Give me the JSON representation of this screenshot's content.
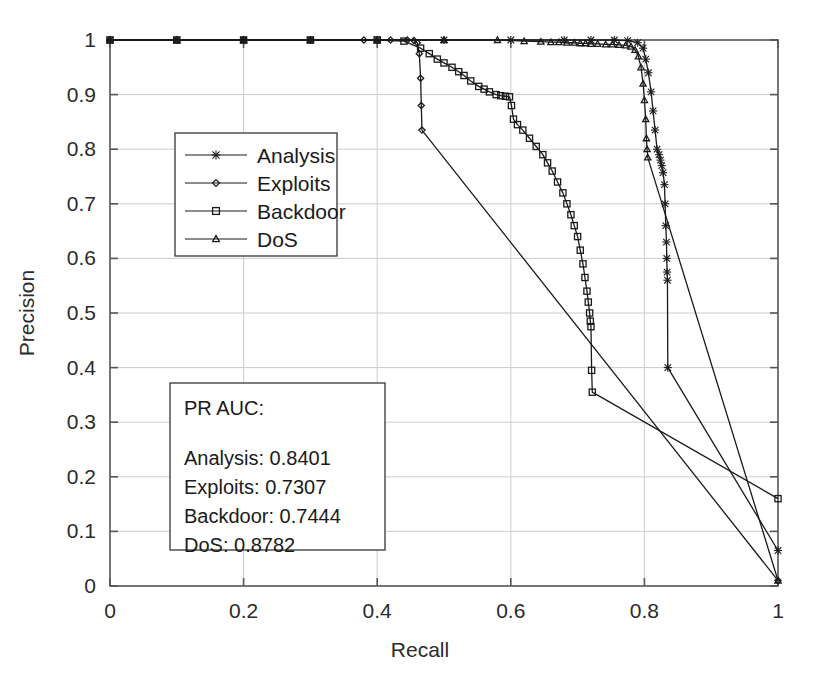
{
  "chart_data": {
    "type": "line",
    "title": "",
    "xlabel": "Recall",
    "ylabel": "Precision",
    "xlim": [
      0,
      1
    ],
    "ylim": [
      0,
      1
    ],
    "grid": true,
    "legend_position": "upper-left-inset",
    "xticks": [
      "0",
      "0.2",
      "0.4",
      "0.6",
      "0.8",
      "1"
    ],
    "xtick_values": [
      0,
      0.2,
      0.4,
      0.6,
      0.8,
      1
    ],
    "yticks": [
      "0",
      "0.1",
      "0.2",
      "0.3",
      "0.4",
      "0.5",
      "0.6",
      "0.7",
      "0.8",
      "0.9",
      "1"
    ],
    "ytick_values": [
      0,
      0.1,
      0.2,
      0.3,
      0.4,
      0.5,
      0.6,
      0.7,
      0.8,
      0.9,
      1
    ],
    "series": [
      {
        "name": "Analysis",
        "marker": "star",
        "color": "#1a1a1a",
        "x": [
          0,
          0.1,
          0.2,
          0.3,
          0.4,
          0.5,
          0.6,
          0.68,
          0.72,
          0.755,
          0.775,
          0.79,
          0.798,
          0.802,
          0.806,
          0.81,
          0.813,
          0.816,
          0.819,
          0.822,
          0.824,
          0.826,
          0.828,
          0.83,
          0.831,
          0.832,
          0.833,
          0.8335,
          0.834,
          0.8345,
          0.835,
          1.0
        ],
        "y": [
          1.0,
          1.0,
          1.0,
          1.0,
          1.0,
          1.0,
          1.0,
          1.0,
          1.0,
          1.0,
          0.999,
          0.995,
          0.985,
          0.965,
          0.94,
          0.905,
          0.87,
          0.835,
          0.8,
          0.79,
          0.78,
          0.77,
          0.757,
          0.735,
          0.7,
          0.66,
          0.63,
          0.6,
          0.575,
          0.56,
          0.4,
          0.065
        ]
      },
      {
        "name": "Exploits",
        "marker": "diamond",
        "color": "#1a1a1a",
        "x": [
          0,
          0.1,
          0.2,
          0.3,
          0.38,
          0.42,
          0.445,
          0.455,
          0.46,
          0.463,
          0.465,
          0.466,
          0.467,
          1.0
        ],
        "y": [
          1.0,
          1.0,
          1.0,
          1.0,
          1.0,
          1.0,
          1.0,
          0.999,
          0.995,
          0.975,
          0.93,
          0.88,
          0.835,
          0.01
        ]
      },
      {
        "name": "Backdoor",
        "marker": "square",
        "color": "#1a1a1a",
        "x": [
          0,
          0.1,
          0.2,
          0.3,
          0.4,
          0.44,
          0.465,
          0.478,
          0.49,
          0.5,
          0.512,
          0.522,
          0.53,
          0.54,
          0.552,
          0.56,
          0.568,
          0.578,
          0.585,
          0.592,
          0.598,
          0.601,
          0.604,
          0.61,
          0.618,
          0.628,
          0.638,
          0.648,
          0.655,
          0.662,
          0.67,
          0.678,
          0.684,
          0.69,
          0.695,
          0.7,
          0.704,
          0.708,
          0.711,
          0.714,
          0.716,
          0.718,
          0.719,
          0.72,
          0.721,
          0.722,
          1.0
        ],
        "y": [
          1.0,
          1.0,
          1.0,
          1.0,
          1.0,
          0.998,
          0.985,
          0.975,
          0.965,
          0.958,
          0.95,
          0.942,
          0.935,
          0.925,
          0.915,
          0.91,
          0.905,
          0.9,
          0.898,
          0.897,
          0.896,
          0.88,
          0.855,
          0.845,
          0.835,
          0.82,
          0.805,
          0.79,
          0.775,
          0.76,
          0.74,
          0.72,
          0.7,
          0.68,
          0.66,
          0.64,
          0.615,
          0.59,
          0.565,
          0.54,
          0.52,
          0.5,
          0.485,
          0.475,
          0.395,
          0.355,
          0.16
        ]
      },
      {
        "name": "DoS",
        "marker": "triangle",
        "color": "#1a1a1a",
        "x": [
          0,
          0.1,
          0.2,
          0.3,
          0.4,
          0.5,
          0.58,
          0.62,
          0.645,
          0.66,
          0.672,
          0.684,
          0.695,
          0.704,
          0.712,
          0.72,
          0.73,
          0.742,
          0.752,
          0.762,
          0.772,
          0.78,
          0.786,
          0.791,
          0.795,
          0.798,
          0.8,
          0.802,
          0.803,
          0.804,
          0.805,
          1.0
        ],
        "y": [
          1.0,
          1.0,
          1.0,
          1.0,
          1.0,
          1.0,
          1.0,
          0.998,
          0.997,
          0.996,
          0.996,
          0.995,
          0.995,
          0.994,
          0.994,
          0.993,
          0.993,
          0.992,
          0.992,
          0.991,
          0.99,
          0.988,
          0.982,
          0.97,
          0.95,
          0.92,
          0.89,
          0.855,
          0.82,
          0.8,
          0.785,
          0.01
        ]
      }
    ]
  },
  "legend": {
    "items": [
      {
        "label": "Analysis",
        "marker": "star"
      },
      {
        "label": "Exploits",
        "marker": "diamond"
      },
      {
        "label": "Backdoor",
        "marker": "square"
      },
      {
        "label": "DoS",
        "marker": "triangle"
      }
    ]
  },
  "auc_box": {
    "title": "PR AUC:",
    "entries": [
      {
        "label": "Analysis:",
        "value": "0.8401",
        "text": "Analysis: 0.8401"
      },
      {
        "label": "Exploits:",
        "value": "0.7307",
        "text": "Exploits: 0.7307"
      },
      {
        "label": "Backdoor:",
        "value": "0.7444",
        "text": "Backdoor: 0.7444"
      },
      {
        "label": "DoS:",
        "value": "0.8782",
        "text": "DoS: 0.8782"
      }
    ]
  },
  "style": {
    "axis_color": "#555555",
    "grid_color": "#cccccc",
    "curve_color": "#1a1a1a",
    "background": "#ffffff"
  }
}
